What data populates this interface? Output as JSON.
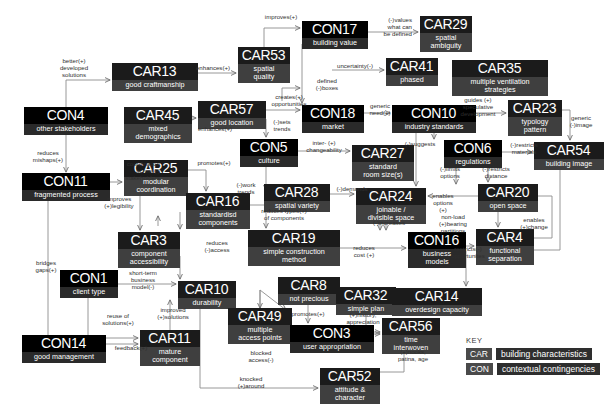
{
  "diagram": {
    "key": {
      "title": "KEY",
      "entries": [
        {
          "tag": "CAR",
          "text": "building characteristics"
        },
        {
          "tag": "CON",
          "text": "contextual contingencies"
        }
      ]
    },
    "nodes": [
      {
        "id": "CAR13",
        "type": "car",
        "code": "CAR13",
        "desc": "good craftmanship",
        "x": 112,
        "y": 63,
        "w": 86
      },
      {
        "id": "CAR53",
        "type": "car",
        "code": "CAR53",
        "desc": "spatial\nquality",
        "x": 238,
        "y": 47,
        "w": 52
      },
      {
        "id": "CON17",
        "type": "con",
        "code": "CON17",
        "desc": "building value",
        "x": 302,
        "y": 21,
        "w": 66
      },
      {
        "id": "CAR29",
        "type": "car",
        "code": "CAR29",
        "desc": "spatial\nambiguity",
        "x": 420,
        "y": 16,
        "w": 52
      },
      {
        "id": "CAR41",
        "type": "car",
        "code": "CAR41",
        "desc": "phased",
        "x": 386,
        "y": 58,
        "w": 52
      },
      {
        "id": "CAR35",
        "type": "car",
        "code": "CAR35",
        "desc": "multiple ventilation\nstrategies",
        "x": 452,
        "y": 60,
        "w": 96
      },
      {
        "id": "CON4",
        "type": "con",
        "code": "CON4",
        "desc": "other stakeholders",
        "x": 24,
        "y": 107,
        "w": 84
      },
      {
        "id": "CAR45",
        "type": "car",
        "code": "CAR45",
        "desc": "mixed\ndemographics",
        "x": 124,
        "y": 107,
        "w": 68
      },
      {
        "id": "CAR57",
        "type": "car",
        "code": "CAR57",
        "desc": "good location",
        "x": 198,
        "y": 101,
        "w": 68
      },
      {
        "id": "CON18",
        "type": "con",
        "code": "CON18",
        "desc": "market",
        "x": 302,
        "y": 105,
        "w": 62
      },
      {
        "id": "CON10",
        "type": "con",
        "code": "CON10",
        "desc": "industry standards",
        "x": 392,
        "y": 105,
        "w": 84
      },
      {
        "id": "CAR23",
        "type": "car",
        "code": "CAR23",
        "desc": "typology\npattern",
        "x": 508,
        "y": 100,
        "w": 54
      },
      {
        "id": "CON5",
        "type": "con",
        "code": "CON5",
        "desc": "culture",
        "x": 240,
        "y": 139,
        "w": 58
      },
      {
        "id": "CAR27",
        "type": "car",
        "code": "CAR27",
        "desc": "standard\nroom size(s)",
        "x": 352,
        "y": 145,
        "w": 62
      },
      {
        "id": "CON6",
        "type": "con",
        "code": "CON6",
        "desc": "regulations",
        "x": 444,
        "y": 140,
        "w": 58
      },
      {
        "id": "CAR54",
        "type": "car",
        "code": "CAR54",
        "desc": "building image",
        "x": 534,
        "y": 142,
        "w": 70
      },
      {
        "id": "CON11",
        "type": "con",
        "code": "CON11",
        "desc": "fragmented process",
        "x": 22,
        "y": 173,
        "w": 88
      },
      {
        "id": "CAR25",
        "type": "car",
        "code": "CAR25",
        "desc": "modular\ncoordination",
        "x": 124,
        "y": 160,
        "w": 64
      },
      {
        "id": "CAR28",
        "type": "car",
        "code": "CAR28",
        "desc": "spatial variety",
        "x": 264,
        "y": 184,
        "w": 66
      },
      {
        "id": "CAR24",
        "type": "car",
        "code": "CAR24",
        "desc": "joinable /\ndivisible space",
        "x": 356,
        "y": 188,
        "w": 70
      },
      {
        "id": "CAR20",
        "type": "car",
        "code": "CAR20",
        "desc": "open space",
        "x": 478,
        "y": 184,
        "w": 60
      },
      {
        "id": "CAR16",
        "type": "car",
        "code": "CAR16",
        "desc": "standardisd\ncomponents",
        "x": 186,
        "y": 193,
        "w": 64
      },
      {
        "id": "CAR19",
        "type": "car",
        "code": "CAR19",
        "desc": "simple construction\nmethod",
        "x": 248,
        "y": 230,
        "w": 92
      },
      {
        "id": "CAR3",
        "type": "car",
        "code": "CAR3",
        "desc": "component\naccessibility",
        "x": 118,
        "y": 232,
        "w": 62
      },
      {
        "id": "CON16",
        "type": "con",
        "code": "CON16",
        "desc": "business\nmodels",
        "x": 408,
        "y": 232,
        "w": 58
      },
      {
        "id": "CAR4",
        "type": "car",
        "code": "CAR4",
        "desc": "functional\nseparation",
        "x": 476,
        "y": 229,
        "w": 58
      },
      {
        "id": "CON1",
        "type": "con",
        "code": "CON1",
        "desc": "client type",
        "x": 60,
        "y": 270,
        "w": 58
      },
      {
        "id": "CAR10",
        "type": "car",
        "code": "CAR10",
        "desc": "durability",
        "x": 178,
        "y": 281,
        "w": 58
      },
      {
        "id": "CAR8",
        "type": "car",
        "code": "CAR8",
        "desc": "not precious",
        "x": 278,
        "y": 277,
        "w": 62
      },
      {
        "id": "CAR32",
        "type": "car",
        "code": "CAR32",
        "desc": "simple plan",
        "x": 336,
        "y": 287,
        "w": 60
      },
      {
        "id": "CAR14",
        "type": "car",
        "code": "CAR14",
        "desc": "overdesign capacity",
        "x": 392,
        "y": 288,
        "w": 90
      },
      {
        "id": "CAR49",
        "type": "car",
        "code": "CAR49",
        "desc": "multiple\naccess points",
        "x": 228,
        "y": 308,
        "w": 64
      },
      {
        "id": "CON3",
        "type": "con",
        "code": "CON3",
        "desc": "user appropriation",
        "x": 290,
        "y": 325,
        "w": 84
      },
      {
        "id": "CAR56",
        "type": "car",
        "code": "CAR56",
        "desc": "time\ninterwoven",
        "x": 382,
        "y": 318,
        "w": 58
      },
      {
        "id": "CAR11",
        "type": "car",
        "code": "CAR11",
        "desc": "mature\ncomponent",
        "x": 140,
        "y": 330,
        "w": 60
      },
      {
        "id": "CON14",
        "type": "con",
        "code": "CON14",
        "desc": "good management",
        "x": 22,
        "y": 335,
        "w": 84
      },
      {
        "id": "CAR52",
        "type": "car",
        "code": "CAR52",
        "desc": "attitude &\ncharacter",
        "x": 320,
        "y": 368,
        "w": 60
      }
    ],
    "edge_labels": [
      {
        "id": "el-better",
        "text": "better(+)\ndeveloped\nsolutions",
        "x": 46,
        "y": 58,
        "w": 56,
        "align": "c"
      },
      {
        "id": "el-enhances-car13",
        "text": "enhances(+)",
        "x": 188,
        "y": 65,
        "w": 50,
        "align": "c"
      },
      {
        "id": "el-improves",
        "text": "improves(+)",
        "x": 256,
        "y": 14,
        "w": 50,
        "align": "c"
      },
      {
        "id": "el-values",
        "text": "(-)values\nwhat can\nbe defined",
        "x": 368,
        "y": 17,
        "w": 44,
        "align": "r"
      },
      {
        "id": "el-uncertainty",
        "text": "uncertainty(-)",
        "x": 328,
        "y": 63,
        "w": 54,
        "align": "c"
      },
      {
        "id": "el-defined",
        "text": "defined\n(-)boxes",
        "x": 310,
        "y": 78,
        "w": 34,
        "align": "c"
      },
      {
        "id": "el-reduces-mishaps",
        "text": "reduces\nmishaps(+)",
        "x": 26,
        "y": 150,
        "w": 44,
        "align": "c"
      },
      {
        "id": "el-enhances-car45",
        "text": "enhances(+)",
        "x": 190,
        "y": 126,
        "w": 50,
        "align": "c"
      },
      {
        "id": "el-creates",
        "text": "creates(+)\nopportunities",
        "x": 264,
        "y": 94,
        "w": 50,
        "align": "c"
      },
      {
        "id": "el-generic-need",
        "text": "generic\nneed(+)",
        "x": 364,
        "y": 103,
        "w": 32,
        "align": "c"
      },
      {
        "id": "el-guides",
        "text": "guides (+)\nspeculative\ndevelopment",
        "x": 452,
        "y": 97,
        "w": 52,
        "align": "c"
      },
      {
        "id": "el-generic-image",
        "text": "generic\n(-)image",
        "x": 564,
        "y": 115,
        "w": 34,
        "align": "c"
      },
      {
        "id": "el-sets-trends",
        "text": "(-)sets\ntrends",
        "x": 268,
        "y": 119,
        "w": 28,
        "align": "c"
      },
      {
        "id": "el-inter",
        "text": "inter- (+)\nchangeability",
        "x": 300,
        "y": 140,
        "w": 48,
        "align": "c"
      },
      {
        "id": "el-suggests",
        "text": "(-)suggests",
        "x": 398,
        "y": 141,
        "w": 44,
        "align": "c"
      },
      {
        "id": "el-restricts-mat",
        "text": "(-)restricts\nmaterials",
        "x": 504,
        "y": 142,
        "w": 40,
        "align": "c"
      },
      {
        "id": "el-coordination",
        "text": "coordination\nacross(-)\nstakeholders",
        "x": 112,
        "y": 161,
        "w": 48,
        "align": "r"
      },
      {
        "id": "el-promotes-car25",
        "text": "promotes(+)",
        "x": 190,
        "y": 160,
        "w": 48,
        "align": "c"
      },
      {
        "id": "el-work-trends",
        "text": "(-)work\ntrends",
        "x": 232,
        "y": 182,
        "w": 28,
        "align": "c"
      },
      {
        "id": "el-demands",
        "text": "(-)demands",
        "x": 330,
        "y": 186,
        "w": 44,
        "align": "c"
      },
      {
        "id": "el-limits",
        "text": "(-)limits\noptions",
        "x": 434,
        "y": 166,
        "w": 32,
        "align": "c"
      },
      {
        "id": "el-restricts-dist",
        "text": "(-)restricts\ndistance",
        "x": 476,
        "y": 166,
        "w": 40,
        "align": "c"
      },
      {
        "id": "el-enables-opt",
        "text": "enables\noptions\n(+)",
        "x": 428,
        "y": 193,
        "w": 30,
        "align": "c"
      },
      {
        "id": "el-improves-leg",
        "text": "improves\n(+)legibility",
        "x": 96,
        "y": 196,
        "w": 46,
        "align": "c"
      },
      {
        "id": "el-reduces-types",
        "text": "reduces types(+)\nof components",
        "x": 252,
        "y": 208,
        "w": 64,
        "align": "c"
      },
      {
        "id": "el-nonload",
        "text": "non-load\n(+)bearing\npartitions",
        "x": 434,
        "y": 214,
        "w": 38,
        "align": "c"
      },
      {
        "id": "el-enables-change",
        "text": "enables\n(+)change",
        "x": 514,
        "y": 217,
        "w": 40,
        "align": "c"
      },
      {
        "id": "el-increases",
        "text": "(-)increases",
        "x": 366,
        "y": 220,
        "w": 46,
        "align": "c"
      },
      {
        "id": "el-reduces-access",
        "text": "reduces\n(-)access",
        "x": 200,
        "y": 240,
        "w": 34,
        "align": "c"
      },
      {
        "id": "el-reduces-cost",
        "text": "reduces\ncost (+)",
        "x": 348,
        "y": 245,
        "w": 32,
        "align": "c"
      },
      {
        "id": "el-restricts-opp",
        "text": "restricts(-)\nopportunites",
        "x": 444,
        "y": 246,
        "w": 48,
        "align": "c"
      },
      {
        "id": "el-bridges",
        "text": "bridges\ngaps(+)",
        "x": 30,
        "y": 260,
        "w": 32,
        "align": "c"
      },
      {
        "id": "el-shortterm",
        "text": "short-term\nbusiness\nmodel(-)",
        "x": 122,
        "y": 270,
        "w": 42,
        "align": "c"
      },
      {
        "id": "el-promotes-car8",
        "text": "promotes(+)",
        "x": 284,
        "y": 311,
        "w": 48,
        "align": "c"
      },
      {
        "id": "el-history",
        "text": "(+)history,\nappreciation",
        "x": 340,
        "y": 312,
        "w": 46,
        "align": "c"
      },
      {
        "id": "el-reuse",
        "text": "reuse of\nsolutions(+)",
        "x": 96,
        "y": 313,
        "w": 44,
        "align": "c"
      },
      {
        "id": "el-improved",
        "text": "improved\n(+)solutions",
        "x": 150,
        "y": 307,
        "w": 46,
        "align": "c"
      },
      {
        "id": "el-feedback",
        "text": "feedback(+)",
        "x": 108,
        "y": 345,
        "w": 46,
        "align": "c"
      },
      {
        "id": "el-blocked",
        "text": "blocked\naccess(-)",
        "x": 244,
        "y": 350,
        "w": 34,
        "align": "c"
      },
      {
        "id": "el-nooks",
        "text": "(+)nooks,\npatina, age",
        "x": 392,
        "y": 349,
        "w": 42,
        "align": "c"
      },
      {
        "id": "el-knocked",
        "text": "knocked\n(+)around",
        "x": 232,
        "y": 376,
        "w": 38,
        "align": "c"
      }
    ]
  }
}
